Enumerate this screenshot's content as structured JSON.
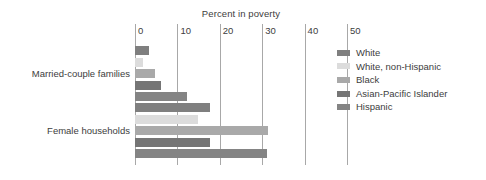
{
  "chart_data": {
    "type": "bar",
    "orientation": "horizontal",
    "title": "Percent in poverty",
    "xlabel": "",
    "ylabel": "",
    "xlim": [
      0,
      50
    ],
    "xticks": [
      0,
      10,
      20,
      30,
      40,
      50
    ],
    "xtick_labels": [
      "0",
      "10",
      "20",
      "30",
      "40",
      "50"
    ],
    "grid": "vertical",
    "legend_position": "right",
    "categories": [
      "Married-couple families",
      "Female households"
    ],
    "series": [
      {
        "name": "White",
        "color": "#7f7f7f",
        "values": [
          3.3,
          17.8
        ]
      },
      {
        "name": "White, non-Hispanic",
        "color": "#dcdcdc",
        "values": [
          1.8,
          14.8
        ]
      },
      {
        "name": "Black",
        "color": "#a9a9a9",
        "values": [
          4.6,
          31.4
        ]
      },
      {
        "name": "Asian-Pacific Islander",
        "color": "#757575",
        "values": [
          6.1,
          17.8
        ]
      },
      {
        "name": "Hispanic",
        "color": "#848484",
        "values": [
          12.2,
          31.2
        ]
      }
    ]
  },
  "axis": {
    "gridline_color": "#a8a8a8",
    "tick_text_color": "#3d3d3d"
  }
}
